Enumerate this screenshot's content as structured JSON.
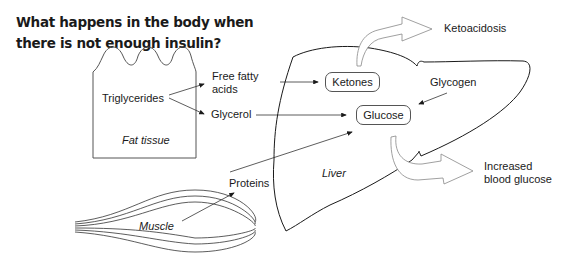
{
  "title": "What happens in the body when there is not enough insulin?",
  "tissues": {
    "fat": "Fat tissue",
    "muscle": "Muscle",
    "liver": "Liver"
  },
  "substances": {
    "triglycerides": "Triglycerides",
    "free_fatty_acids_line1": "Free fatty",
    "free_fatty_acids_line2": "acids",
    "glycerol": "Glycerol",
    "proteins": "Proteins",
    "glycogen": "Glycogen",
    "ketones": "Ketones",
    "glucose": "Glucose"
  },
  "outcomes": {
    "ketoacidosis": "Ketoacidosis",
    "increased_blood_glucose_line1": "Increased",
    "increased_blood_glucose_line2": "blood glucose"
  },
  "colors": {
    "line": "#1a1a1a",
    "arrow_outline": "#888888",
    "background": "#ffffff"
  }
}
